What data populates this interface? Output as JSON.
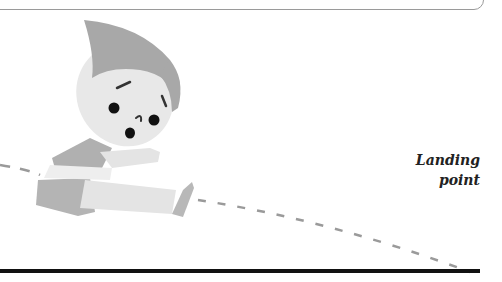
{
  "diagram": {
    "type": "illustration",
    "label": {
      "line1": "Landing",
      "line2": "point"
    },
    "trajectory": "dashed-curve",
    "ground": "solid-black-line",
    "colors": {
      "hair": "#a8a8a8",
      "skin": "#e8e8e8",
      "shirt": "#b0b0b0",
      "shorts": "#b4b4b4",
      "limbs": "#e4e4e4",
      "shoe": "#b8b8b8",
      "dash": "#9a9a9a",
      "ground": "#111111",
      "text": "#222222"
    }
  }
}
